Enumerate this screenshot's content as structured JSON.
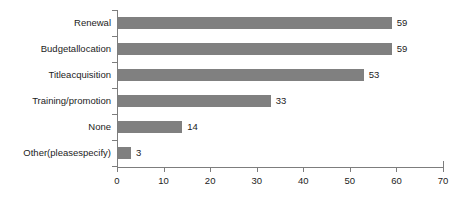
{
  "chart_data": {
    "type": "bar",
    "orientation": "horizontal",
    "title": "",
    "xlabel": "",
    "ylabel": "",
    "categories": [
      "Renewal",
      "Budgetallocation",
      "Titleacquisition",
      "Training/promotion",
      "None",
      "Other(pleasespecify)"
    ],
    "values": [
      59,
      59,
      53,
      33,
      14,
      3
    ],
    "value_labels": [
      "59",
      "59",
      "53",
      "33",
      "14",
      "3"
    ],
    "xlim": [
      0,
      70
    ],
    "xticks": [
      0,
      10,
      20,
      30,
      40,
      50,
      60,
      70
    ],
    "xtick_labels": [
      "0",
      "10",
      "20",
      "30",
      "40",
      "50",
      "60",
      "70"
    ],
    "grid": false,
    "legend": false,
    "bar_color": "#808080",
    "axis_color": "#7d7d7d",
    "text_color": "#1c1c1c",
    "background": "#ffffff"
  }
}
